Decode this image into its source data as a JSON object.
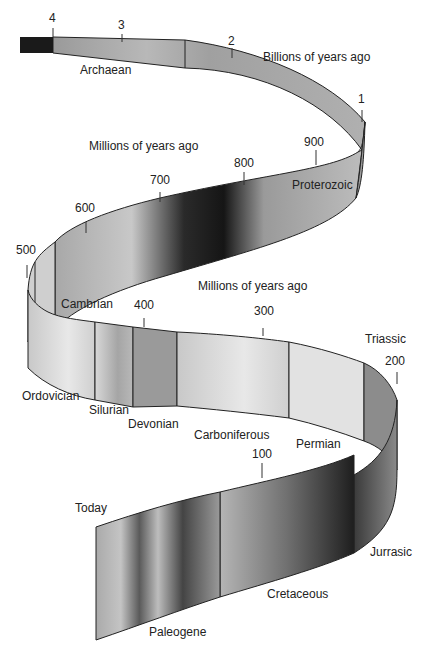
{
  "diagram": {
    "units": {
      "billions": "Billions of years ago",
      "millions_upper": "Millions of  years ago",
      "millions_lower": "Millions of  years ago"
    },
    "ticks": {
      "t4": "4",
      "t3": "3",
      "t2": "2",
      "t1": "1",
      "t900": "900",
      "t800": "800",
      "t700": "700",
      "t600": "600",
      "t500": "500",
      "t400": "400",
      "t300": "300",
      "t200": "200",
      "t100": "100",
      "today": "Today"
    },
    "eras": {
      "archaean": "Archaean",
      "proterozoic": "Proterozoic",
      "cambrian": "Cambrian",
      "ordovician": "Ordovician",
      "silurian": "Silurian",
      "devonian": "Devonian",
      "carboniferous": "Carboniferous",
      "permian": "Permian",
      "triassic": "Triassic",
      "jurrasic": "Jurrasic",
      "cretaceous": "Cretaceous",
      "paleogene": "Paleogene"
    },
    "colors": {
      "ribbon_dark": "#1a1a1a",
      "ribbon_mid": "#8c8c8c",
      "ribbon_light": "#dcdcdc",
      "outline": "#111111"
    }
  }
}
